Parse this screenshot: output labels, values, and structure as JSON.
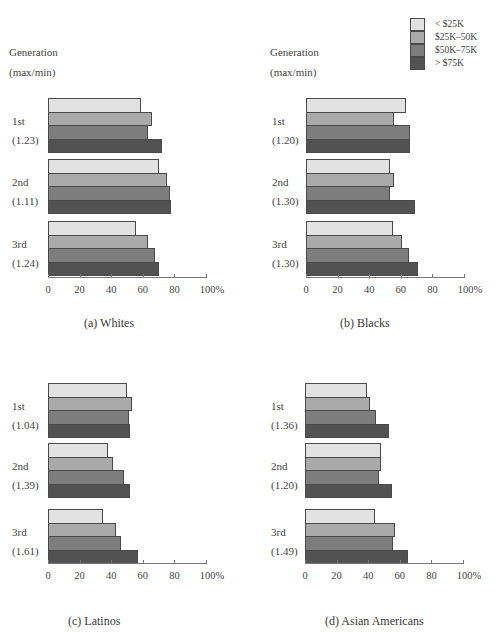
{
  "legend": {
    "items": [
      {
        "label": "< $25K",
        "color": "#e2e2e2"
      },
      {
        "label": "$25K–50K",
        "color": "#aaaaaa"
      },
      {
        "label": "$50K–75K",
        "color": "#7d7d7d"
      },
      {
        "label": "> $75K",
        "color": "#525252"
      }
    ]
  },
  "header": {
    "line1": "Generation",
    "line2": "(max/min)"
  },
  "axis": {
    "ticks": [
      "0",
      "20",
      "40",
      "60",
      "80",
      "100%"
    ]
  },
  "panels": [
    {
      "caption": "(a) Whites",
      "groups": [
        {
          "label": "1st",
          "ratio": "(1.23)",
          "values": [
            59,
            66,
            63,
            72
          ]
        },
        {
          "label": "2nd",
          "ratio": "(1.11)",
          "values": [
            70,
            75,
            77,
            78
          ]
        },
        {
          "label": "3rd",
          "ratio": "(1.24)",
          "values": [
            56,
            63,
            68,
            70
          ]
        }
      ]
    },
    {
      "caption": "(b) Blacks",
      "groups": [
        {
          "label": "1st",
          "ratio": "(1.20)",
          "values": [
            63,
            56,
            66,
            66
          ]
        },
        {
          "label": "2nd",
          "ratio": "(1.30)",
          "values": [
            53,
            56,
            53,
            69
          ]
        },
        {
          "label": "3rd",
          "ratio": "(1.30)",
          "values": [
            55,
            61,
            65,
            71
          ]
        }
      ]
    },
    {
      "caption": "(c) Latinos",
      "groups": [
        {
          "label": "1st",
          "ratio": "(1.04)",
          "values": [
            50,
            53,
            51,
            52
          ]
        },
        {
          "label": "2nd",
          "ratio": "(1.39)",
          "values": [
            38,
            41,
            48,
            52
          ]
        },
        {
          "label": "3rd",
          "ratio": "(1.61)",
          "values": [
            35,
            43,
            46,
            57
          ]
        }
      ]
    },
    {
      "caption": "(d) Asian Americans",
      "groups": [
        {
          "label": "1st",
          "ratio": "(1.36)",
          "values": [
            39,
            41,
            45,
            53
          ]
        },
        {
          "label": "2nd",
          "ratio": "(1.20)",
          "values": [
            48,
            48,
            47,
            55
          ]
        },
        {
          "label": "3rd",
          "ratio": "(1.49)",
          "values": [
            44,
            57,
            56,
            65
          ]
        }
      ]
    }
  ],
  "chart_data": [
    {
      "type": "bar",
      "orientation": "horizontal",
      "title": "(a) Whites",
      "categories": [
        "1st (1.23)",
        "2nd (1.11)",
        "3rd (1.24)"
      ],
      "ylabel": "Generation (max/min)",
      "xlabel": "",
      "xlim": [
        0,
        100
      ],
      "xticks": [
        "0",
        "20",
        "40",
        "60",
        "80",
        "100%"
      ],
      "series": [
        {
          "name": "< $25K",
          "values": [
            59,
            70,
            56
          ]
        },
        {
          "name": "$25K–50K",
          "values": [
            66,
            75,
            63
          ]
        },
        {
          "name": "$50K–75K",
          "values": [
            63,
            77,
            68
          ]
        },
        {
          "name": "> $75K",
          "values": [
            72,
            78,
            70
          ]
        }
      ],
      "grid": false,
      "legend_position": "top-right"
    },
    {
      "type": "bar",
      "orientation": "horizontal",
      "title": "(b) Blacks",
      "categories": [
        "1st (1.20)",
        "2nd (1.30)",
        "3rd (1.30)"
      ],
      "ylabel": "Generation (max/min)",
      "xlabel": "",
      "xlim": [
        0,
        100
      ],
      "xticks": [
        "0",
        "20",
        "40",
        "60",
        "80",
        "100%"
      ],
      "series": [
        {
          "name": "< $25K",
          "values": [
            63,
            53,
            55
          ]
        },
        {
          "name": "$25K–50K",
          "values": [
            56,
            56,
            61
          ]
        },
        {
          "name": "$50K–75K",
          "values": [
            66,
            53,
            65
          ]
        },
        {
          "name": "> $75K",
          "values": [
            66,
            69,
            71
          ]
        }
      ],
      "grid": false
    },
    {
      "type": "bar",
      "orientation": "horizontal",
      "title": "(c) Latinos",
      "categories": [
        "1st (1.04)",
        "2nd (1.39)",
        "3rd (1.61)"
      ],
      "xlabel": "",
      "xlim": [
        0,
        100
      ],
      "xticks": [
        "0",
        "20",
        "40",
        "60",
        "80",
        "100%"
      ],
      "series": [
        {
          "name": "< $25K",
          "values": [
            50,
            38,
            35
          ]
        },
        {
          "name": "$25K–50K",
          "values": [
            53,
            41,
            43
          ]
        },
        {
          "name": "$50K–75K",
          "values": [
            51,
            48,
            46
          ]
        },
        {
          "name": "> $75K",
          "values": [
            52,
            52,
            57
          ]
        }
      ],
      "grid": false
    },
    {
      "type": "bar",
      "orientation": "horizontal",
      "title": "(d) Asian Americans",
      "categories": [
        "1st (1.36)",
        "2nd (1.20)",
        "3rd (1.49)"
      ],
      "xlabel": "",
      "xlim": [
        0,
        100
      ],
      "xticks": [
        "0",
        "20",
        "40",
        "60",
        "80",
        "100%"
      ],
      "series": [
        {
          "name": "< $25K",
          "values": [
            39,
            48,
            44
          ]
        },
        {
          "name": "$25K–50K",
          "values": [
            41,
            48,
            57
          ]
        },
        {
          "name": "$50K–75K",
          "values": [
            45,
            47,
            56
          ]
        },
        {
          "name": "> $75K",
          "values": [
            53,
            55,
            65
          ]
        }
      ],
      "grid": false
    }
  ]
}
